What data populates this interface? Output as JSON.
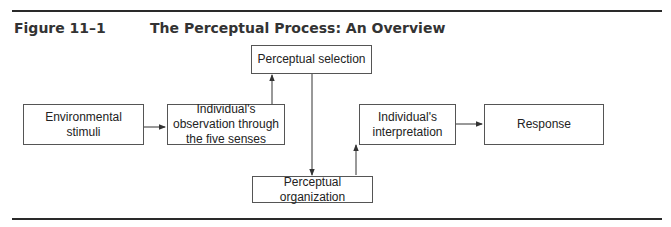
{
  "figure": {
    "label": "Figure 11–1",
    "title": "The Perceptual Process: An Overview"
  },
  "nodes": {
    "environmental_stimuli": "Environmental stimuli",
    "observation": "Individual's observation through the five senses",
    "selection": "Perceptual selection",
    "organization": "Perceptual organization",
    "interpretation": "Individual's interpretation",
    "response": "Response"
  },
  "edges": [
    {
      "from": "Environmental stimuli",
      "to": "Individual's observation through the five senses"
    },
    {
      "from": "Individual's observation through the five senses",
      "to": "Perceptual selection"
    },
    {
      "from": "Perceptual selection",
      "to": "Perceptual organization"
    },
    {
      "from": "Perceptual organization",
      "to": "Individual's interpretation"
    },
    {
      "from": "Individual's interpretation",
      "to": "Response"
    }
  ]
}
